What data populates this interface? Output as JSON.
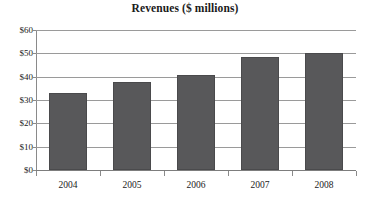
{
  "chart_data": {
    "type": "bar",
    "title": "Revenues ($ millions)",
    "xlabel": "",
    "ylabel": "",
    "categories": [
      "2004",
      "2005",
      "2006",
      "2007",
      "2008"
    ],
    "values": [
      33.2,
      37.9,
      40.6,
      48.3,
      50.2
    ],
    "series": [
      {
        "name": "Revenues",
        "values": [
          33.2,
          37.9,
          40.6,
          48.3,
          50.2
        ]
      }
    ],
    "ylim": [
      0,
      60
    ],
    "ytick_values": [
      0,
      10,
      20,
      30,
      40,
      50,
      60
    ],
    "ytick_labels": [
      "$0",
      "$10",
      "$20",
      "$30",
      "$40",
      "$50",
      "$60"
    ],
    "xtick_labels": [
      "2004",
      "2005",
      "2006",
      "2007",
      "2008"
    ],
    "grid": true,
    "grid_axis": "y",
    "legend": false,
    "legend_position": "none",
    "bar_color": "#58585a",
    "bar_border_color": "#4a4a4c",
    "gridline_color": "#9a9a9a",
    "axis_color": "#7d7d7d",
    "text_color": "#1a1a1a",
    "background": "#ffffff"
  }
}
